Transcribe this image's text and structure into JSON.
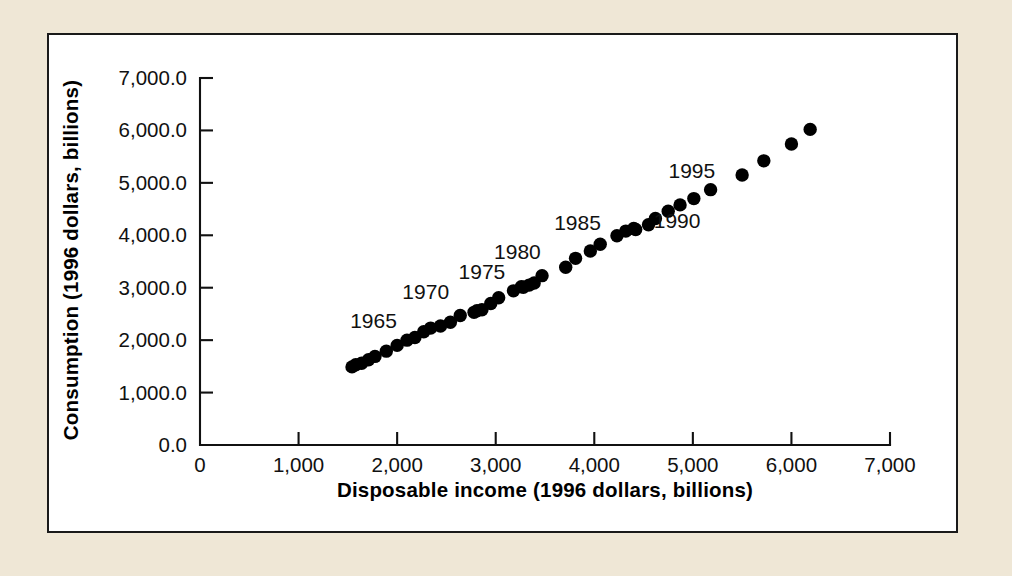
{
  "chart_data": {
    "type": "scatter",
    "title": "",
    "xlabel": "Disposable income (1996 dollars, billions)",
    "ylabel": "Consumption (1996 dollars, billions)",
    "xlim": [
      0,
      7000
    ],
    "ylim": [
      0,
      7000
    ],
    "xticks": [
      0,
      1000,
      2000,
      3000,
      4000,
      5000,
      6000,
      7000
    ],
    "yticks": [
      0,
      1000,
      2000,
      3000,
      4000,
      5000,
      6000,
      7000
    ],
    "xtick_labels": [
      "0",
      "1,000",
      "2,000",
      "3,000",
      "4,000",
      "5,000",
      "6,000",
      "7,000"
    ],
    "ytick_labels": [
      "0.0",
      "1,000.0",
      "2,000.0",
      "3,000.0",
      "4,000.0",
      "5,000.0",
      "6,000.0",
      "7,000.0"
    ],
    "grid": false,
    "legend": false,
    "marker_color": "#000000",
    "marker_size": 9,
    "points": [
      {
        "year": 1959,
        "x": 1542,
        "y": 1490
      },
      {
        "year": 1960,
        "x": 1580,
        "y": 1530
      },
      {
        "year": 1961,
        "x": 1640,
        "y": 1558
      },
      {
        "year": 1962,
        "x": 1710,
        "y": 1625
      },
      {
        "year": 1963,
        "x": 1775,
        "y": 1690
      },
      {
        "year": 1964,
        "x": 1890,
        "y": 1790
      },
      {
        "year": 1965,
        "x": 2000,
        "y": 1900
      },
      {
        "year": 1966,
        "x": 2100,
        "y": 2000
      },
      {
        "year": 1967,
        "x": 2180,
        "y": 2050
      },
      {
        "year": 1968,
        "x": 2270,
        "y": 2160
      },
      {
        "year": 1969,
        "x": 2340,
        "y": 2230
      },
      {
        "year": 1970,
        "x": 2440,
        "y": 2270
      },
      {
        "year": 1971,
        "x": 2540,
        "y": 2340
      },
      {
        "year": 1972,
        "x": 2640,
        "y": 2470
      },
      {
        "year": 1973,
        "x": 2810,
        "y": 2560
      },
      {
        "year": 1974,
        "x": 2780,
        "y": 2530
      },
      {
        "year": 1975,
        "x": 2860,
        "y": 2580
      },
      {
        "year": 1976,
        "x": 2950,
        "y": 2700
      },
      {
        "year": 1977,
        "x": 3030,
        "y": 2810
      },
      {
        "year": 1978,
        "x": 3180,
        "y": 2940
      },
      {
        "year": 1979,
        "x": 3260,
        "y": 3020
      },
      {
        "year": 1980,
        "x": 3280,
        "y": 3010
      },
      {
        "year": 1981,
        "x": 3340,
        "y": 3050
      },
      {
        "year": 1982,
        "x": 3390,
        "y": 3090
      },
      {
        "year": 1983,
        "x": 3470,
        "y": 3230
      },
      {
        "year": 1984,
        "x": 3710,
        "y": 3390
      },
      {
        "year": 1985,
        "x": 3810,
        "y": 3560
      },
      {
        "year": 1986,
        "x": 3960,
        "y": 3700
      },
      {
        "year": 1987,
        "x": 4060,
        "y": 3830
      },
      {
        "year": 1988,
        "x": 4230,
        "y": 3990
      },
      {
        "year": 1989,
        "x": 4320,
        "y": 4080
      },
      {
        "year": 1990,
        "x": 4400,
        "y": 4130
      },
      {
        "year": 1991,
        "x": 4420,
        "y": 4110
      },
      {
        "year": 1992,
        "x": 4550,
        "y": 4200
      },
      {
        "year": 1993,
        "x": 4620,
        "y": 4320
      },
      {
        "year": 1994,
        "x": 4750,
        "y": 4460
      },
      {
        "year": 1995,
        "x": 4870,
        "y": 4580
      },
      {
        "year": 1996,
        "x": 5010,
        "y": 4700
      },
      {
        "year": 1997,
        "x": 5180,
        "y": 4870
      },
      {
        "year": 1998,
        "x": 5500,
        "y": 5150
      },
      {
        "year": 1999,
        "x": 5720,
        "y": 5420
      },
      {
        "year": 2000,
        "x": 6000,
        "y": 5740
      },
      {
        "year": 2001,
        "x": 6190,
        "y": 6020
      }
    ],
    "annotations": [
      {
        "label": "1965",
        "x": 1760,
        "y": 2230
      },
      {
        "label": "1970",
        "x": 2290,
        "y": 2790
      },
      {
        "label": "1975",
        "x": 2860,
        "y": 3170
      },
      {
        "label": "1980",
        "x": 3220,
        "y": 3540
      },
      {
        "label": "1985",
        "x": 3830,
        "y": 4100
      },
      {
        "label": "1990",
        "x": 4840,
        "y": 4130
      },
      {
        "label": "1995",
        "x": 4990,
        "y": 5090
      }
    ]
  },
  "figure": {
    "background_color": "#efe7d6",
    "panel_color": "#ffffff",
    "border_color": "#1a1a1a"
  }
}
